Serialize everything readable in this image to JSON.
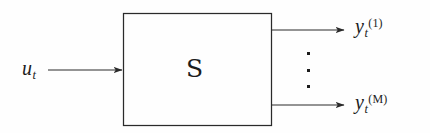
{
  "diagram": {
    "background_color": "#fefefe",
    "stroke_color": "#2a2a2a",
    "text_color": "#1c1c1c",
    "block": {
      "label_base": "S",
      "label_style": "calligraphic",
      "x": 123,
      "y": 13,
      "width": 149,
      "height": 113
    },
    "input": {
      "label_base": "u",
      "label_sub": "t",
      "arrow_from_x": 48,
      "arrow_to_x": 123,
      "arrow_y": 70
    },
    "outputs": [
      {
        "label_base": "y",
        "label_sub": "t",
        "label_sup": "(1)",
        "arrow_from_x": 272,
        "arrow_to_x": 345,
        "arrow_y": 30
      },
      {
        "label_base": "y",
        "label_sub": "t",
        "label_sup": "(M)",
        "arrow_from_x": 272,
        "arrow_to_x": 345,
        "arrow_y": 105
      }
    ],
    "ellipsis": {
      "glyph": "vertical-dots",
      "count": 3
    }
  }
}
